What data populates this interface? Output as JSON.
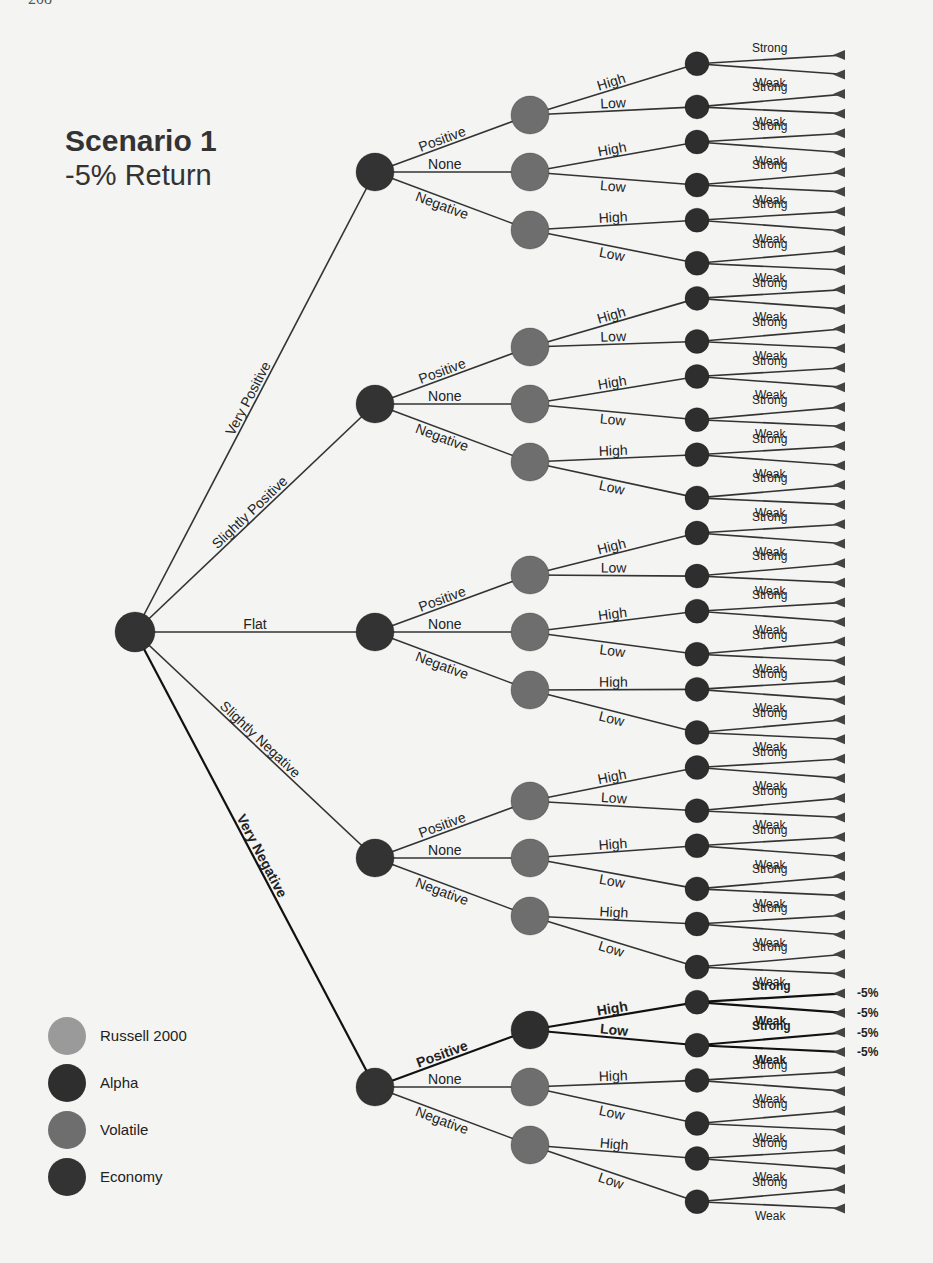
{
  "page": {
    "number": "208"
  },
  "title": {
    "main": "Scenario 1",
    "sub": "-5% Return"
  },
  "colors": {
    "russell": "#8f8f8f",
    "alpha": "#2e2e2e",
    "volatile": "#6e6e6e",
    "economy": "#333333",
    "edge": "#333333",
    "background": "#f4f4f2"
  },
  "legend": [
    {
      "label": "Russell 2000",
      "color": "#9a9a9a"
    },
    {
      "label": "Alpha",
      "color": "#2e2e2e"
    },
    {
      "label": "Volatile",
      "color": "#6e6e6e"
    },
    {
      "label": "Economy",
      "color": "#333333"
    }
  ],
  "tree": {
    "root": {
      "type": "economy",
      "x": 135,
      "y": 632,
      "r": 20
    },
    "level1": {
      "labels": [
        "Very Positive",
        "Slightly Positive",
        "Flat",
        "Slightly Negative",
        "Very Negative"
      ],
      "y": [
        172,
        404,
        632,
        858,
        1087
      ],
      "x": 375,
      "r": 19,
      "label_styles": [
        "normal",
        "light",
        "normal",
        "light",
        "bold"
      ]
    },
    "level2": {
      "labels": [
        "Positive",
        "None",
        "Negative"
      ],
      "x": 530,
      "r": 19,
      "offsets": [
        -57,
        0,
        58
      ]
    },
    "level3": {
      "labels": [
        "High",
        "Low"
      ],
      "x": 697,
      "r": 12
    },
    "leaves": {
      "labels": [
        "Strong",
        "Weak"
      ],
      "x": 845,
      "y_start": 55,
      "spacing": 19.55,
      "count": 60
    },
    "highlight_path": {
      "level1_index": 4,
      "level2_index": 0,
      "outcome_label": "-5%",
      "outcomes": [
        "-5%",
        "-5%",
        "-5%",
        "-5%"
      ]
    }
  },
  "chart_data": {
    "type": "tree",
    "title": "Scenario 1",
    "subtitle": "-5% Return",
    "levels": [
      {
        "factor": "Economy",
        "branches": [
          "Very Positive",
          "Slightly Positive",
          "Flat",
          "Slightly Negative",
          "Very Negative"
        ]
      },
      {
        "factor": "Volatile",
        "branches": [
          "Positive",
          "None",
          "Negative"
        ]
      },
      {
        "factor": "Alpha",
        "branches": [
          "High",
          "Low"
        ]
      },
      {
        "factor": "Russell 2000",
        "branches": [
          "Strong",
          "Weak"
        ]
      }
    ],
    "total_leaves": 60,
    "highlighted_path": [
      "Very Negative",
      "Positive",
      "High/Low",
      "Strong/Weak"
    ],
    "highlighted_outcomes": [
      "-5%",
      "-5%",
      "-5%",
      "-5%"
    ],
    "legend": [
      "Russell 2000",
      "Alpha",
      "Volatile",
      "Economy"
    ]
  }
}
